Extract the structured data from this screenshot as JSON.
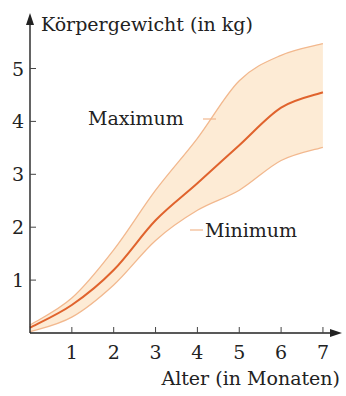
{
  "chart_data": {
    "type": "area",
    "title": "",
    "xlabel": "Alter (in Monaten)",
    "ylabel": "Körpergewicht (in kg)",
    "x": [
      0,
      1,
      2,
      3,
      4,
      5,
      6,
      7
    ],
    "xticks": [
      "1",
      "2",
      "3",
      "4",
      "5",
      "6",
      "7"
    ],
    "yticks": [
      "1",
      "2",
      "3",
      "4",
      "5"
    ],
    "xlim": [
      0,
      7.3
    ],
    "ylim": [
      0,
      5.6
    ],
    "grid": false,
    "legend": "none",
    "series": [
      {
        "name": "Maximum",
        "values": [
          0.15,
          0.66,
          1.57,
          2.7,
          3.68,
          4.77,
          5.25,
          5.47
        ],
        "role": "upper-bound"
      },
      {
        "name": "Mittelwert",
        "values": [
          0.1,
          0.53,
          1.19,
          2.13,
          2.83,
          3.55,
          4.26,
          4.55
        ],
        "role": "center-line"
      },
      {
        "name": "Minimum",
        "values": [
          0.02,
          0.3,
          0.91,
          1.75,
          2.32,
          2.7,
          3.26,
          3.51
        ],
        "role": "lower-bound"
      }
    ],
    "annotations": [
      {
        "text": "Maximum",
        "points_to": "upper-bound"
      },
      {
        "text": "Minimum",
        "points_to": "lower-bound"
      }
    ],
    "colors": {
      "band_fill": "#fdebd5",
      "bound_line": "#f2b88e",
      "center_line": "#e0632d",
      "axis": "#222222"
    }
  }
}
